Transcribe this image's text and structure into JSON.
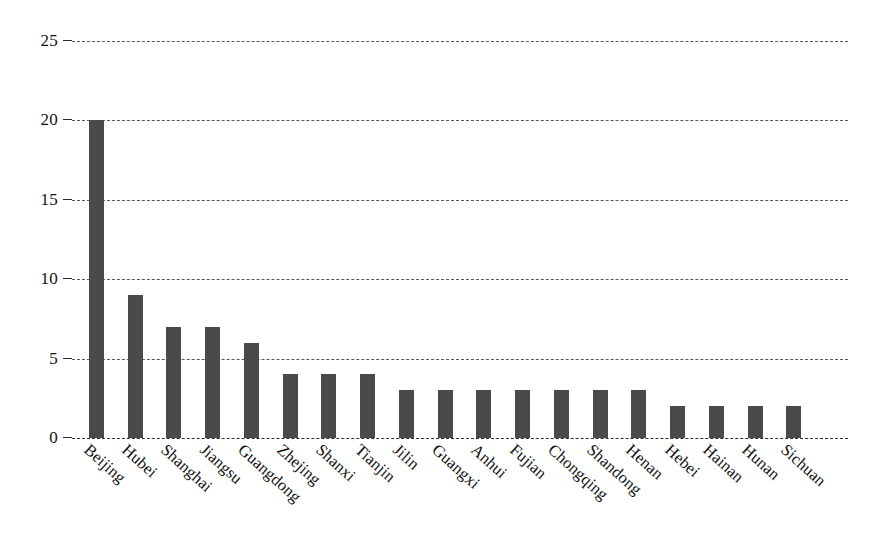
{
  "chart_data": {
    "type": "bar",
    "title": "",
    "subtitle": "",
    "xlabel": "",
    "ylabel": "",
    "ylim": [
      0,
      25
    ],
    "yticks": [
      0,
      5,
      10,
      15,
      20,
      25
    ],
    "ytick_labels": [
      "0",
      "5",
      "10",
      "15",
      "20",
      "25"
    ],
    "grid": true,
    "grid_axis": "y",
    "legend": false,
    "legend_position": "none",
    "orientation": "vertical",
    "bar_color": "#4a4a4a",
    "background_color": "#ffffff",
    "categories": [
      "Beijing",
      "Hubei",
      "Shanghai",
      "Jiangsu",
      "Guangdong",
      "Zhejing",
      "Shanxi",
      "Tianjin",
      "Jilin",
      "Guangxi",
      "Anhui",
      "Fujian",
      "Chongqing",
      "Shandong",
      "Henan",
      "Hebei",
      "Hainan",
      "Hunan",
      "Sichuan"
    ],
    "values": [
      20,
      9,
      7,
      7,
      6,
      4,
      4,
      4,
      3,
      3,
      3,
      3,
      3,
      3,
      3,
      2,
      2,
      2,
      2
    ],
    "annotations": []
  }
}
